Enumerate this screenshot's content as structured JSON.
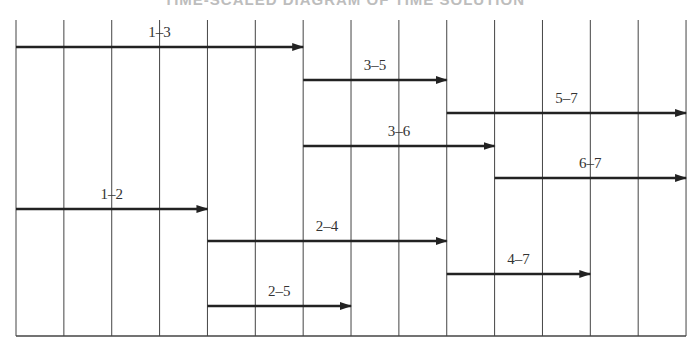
{
  "title": "TIME-SCALED DIAGRAM OF TIME SOLUTION",
  "chart_data": {
    "type": "diagram",
    "grid": {
      "x_start": 16,
      "unit_width": 47.86,
      "units": 14,
      "y_top": 20,
      "y_bottom": 336
    },
    "activities": [
      {
        "label": "1–3",
        "start": 0,
        "end": 6,
        "y": 47
      },
      {
        "label": "3–5",
        "start": 6,
        "end": 9,
        "y": 80
      },
      {
        "label": "5–7",
        "start": 9,
        "end": 14,
        "y": 113
      },
      {
        "label": "3–6",
        "start": 6,
        "end": 10,
        "y": 146
      },
      {
        "label": "6–7",
        "start": 10,
        "end": 14,
        "y": 178
      },
      {
        "label": "1–2",
        "start": 0,
        "end": 4,
        "y": 209
      },
      {
        "label": "2–4",
        "start": 4,
        "end": 9,
        "y": 241
      },
      {
        "label": "4–7",
        "start": 9,
        "end": 12,
        "y": 274
      },
      {
        "label": "2–5",
        "start": 4,
        "end": 7,
        "y": 306
      }
    ]
  },
  "colors": {
    "line": "#222222",
    "grid": "#444444",
    "label": "#333333"
  }
}
